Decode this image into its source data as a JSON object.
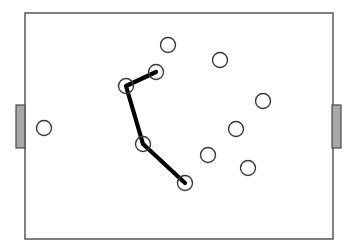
{
  "diagram": {
    "canvas": {
      "width": 353,
      "height": 250,
      "background": "#ffffff"
    },
    "field": {
      "name": "pitch-boundary",
      "x": 25,
      "y": 13,
      "width": 308,
      "height": 226,
      "stroke": "#4a4a4a",
      "stroke_width": 1.4,
      "fill": "#ffffff"
    },
    "goals": [
      {
        "name": "goal-left",
        "side": "left",
        "x": 16,
        "y": 105,
        "width": 9,
        "height": 43,
        "fill": "#a8a8a8",
        "stroke": "#4a4a4a",
        "stroke_width": 1.2
      },
      {
        "name": "goal-right",
        "side": "right",
        "x": 332,
        "y": 105,
        "width": 9,
        "height": 43,
        "fill": "#a8a8a8",
        "stroke": "#4a4a4a",
        "stroke_width": 1.2
      }
    ],
    "player_style": {
      "radius": 7.5,
      "stroke": "#3a3a3a",
      "stroke_width": 1.4,
      "fill": "#ffffff"
    },
    "players": [
      {
        "name": "player-marker",
        "id": "p1",
        "cx": 44,
        "cy": 128,
        "on_path": false
      },
      {
        "name": "player-marker",
        "id": "p2",
        "cx": 168,
        "cy": 45,
        "on_path": false
      },
      {
        "name": "player-marker",
        "id": "p3",
        "cx": 220,
        "cy": 60,
        "on_path": false
      },
      {
        "name": "player-marker",
        "id": "p4",
        "cx": 263,
        "cy": 101,
        "on_path": false
      },
      {
        "name": "player-marker",
        "id": "p5",
        "cx": 236,
        "cy": 129,
        "on_path": false
      },
      {
        "name": "player-marker",
        "id": "p6",
        "cx": 208,
        "cy": 155,
        "on_path": false
      },
      {
        "name": "player-marker",
        "id": "p7",
        "cx": 248,
        "cy": 168,
        "on_path": false
      },
      {
        "name": "player-marker",
        "id": "n1",
        "cx": 156,
        "cy": 72,
        "on_path": true
      },
      {
        "name": "player-marker",
        "id": "n2",
        "cx": 126,
        "cy": 86,
        "on_path": true
      },
      {
        "name": "player-marker",
        "id": "n3",
        "cx": 143,
        "cy": 144,
        "on_path": true
      },
      {
        "name": "player-marker",
        "id": "n4",
        "cx": 185,
        "cy": 183,
        "on_path": true
      }
    ],
    "pass_path": {
      "name": "pass-sequence-path",
      "points": "156,72 126,86 143,144 185,183",
      "stroke": "#000000",
      "stroke_width": 4.2,
      "fill": "none"
    }
  }
}
